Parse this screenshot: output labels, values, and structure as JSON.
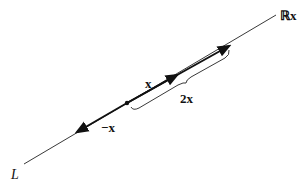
{
  "diagram": {
    "labels": {
      "line_name": "L",
      "span": "ℝx",
      "vector_x": "x",
      "vector_2x": "2x",
      "vector_neg_x": "−x"
    },
    "colors": {
      "line": "#222222",
      "vector": "#111111",
      "text": "#111111"
    }
  }
}
